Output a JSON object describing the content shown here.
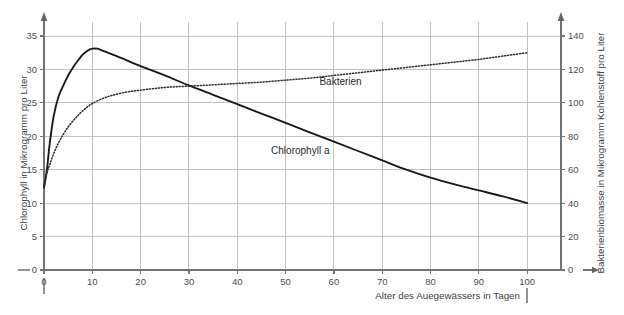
{
  "chart_data": {
    "type": "line",
    "title": "",
    "xlabel": "Alter des Auegewässers in Tagen",
    "ylabel": "Chlorophyll in Mikrogramm pro Liter",
    "y2label": "Bakterienbiomasse in Mikrogramm Kohlenstoff pro Liter",
    "xlim": [
      0,
      107
    ],
    "ylim": [
      0,
      36.5
    ],
    "y2lim": [
      0,
      146
    ],
    "grid": true,
    "legend_position": "inline-labels",
    "x_ticks": [
      0,
      10,
      20,
      30,
      40,
      50,
      60,
      70,
      80,
      90,
      100
    ],
    "x_tick_labels": [
      "0",
      "10",
      "20",
      "30",
      "40",
      "50",
      "60",
      "70",
      "80",
      "90",
      "100"
    ],
    "y_ticks": [
      0,
      5,
      10,
      15,
      20,
      25,
      30,
      35
    ],
    "y_tick_labels": [
      "0",
      "5",
      "10",
      "15",
      "20",
      "25",
      "30",
      "35"
    ],
    "y2_ticks": [
      0,
      20,
      40,
      60,
      80,
      100,
      120,
      140
    ],
    "y2_tick_labels": [
      "0",
      "20",
      "40",
      "60",
      "80",
      "100",
      "120",
      "140"
    ],
    "series": [
      {
        "name": "Chlorophyll a",
        "axis": "left",
        "style": "solid",
        "label_x": 47,
        "label_y": 17.9,
        "x": [
          0,
          0.6,
          1.2,
          2,
          3,
          4,
          5,
          6,
          7,
          8,
          9,
          10,
          11,
          12,
          14,
          17,
          20,
          25,
          30,
          35,
          40,
          45,
          50,
          55,
          60,
          65,
          70,
          75,
          80,
          85,
          90,
          95,
          100
        ],
        "y": [
          12.3,
          15.0,
          19.0,
          23.0,
          25.9,
          27.6,
          29.1,
          30.3,
          31.3,
          32.2,
          32.8,
          33.1,
          33.1,
          32.85,
          32.3,
          31.4,
          30.5,
          29.1,
          27.6,
          26.2,
          24.8,
          23.4,
          22.0,
          20.6,
          19.2,
          17.8,
          16.4,
          15.0,
          13.8,
          12.8,
          11.9,
          11.0,
          10.0
        ]
      },
      {
        "name": "Bakterien",
        "axis": "right",
        "style": "dotted",
        "label_x": 57,
        "label_y": 28.2,
        "x": [
          0,
          0.6,
          1.2,
          2,
          3,
          4,
          5,
          6,
          7,
          8,
          9,
          10,
          12,
          14,
          17,
          20,
          25,
          30,
          35,
          40,
          45,
          50,
          55,
          60,
          65,
          70,
          75,
          80,
          85,
          90,
          95,
          100
        ],
        "y_left_equiv": [
          12.3,
          14.5,
          15.8,
          17.4,
          19.0,
          20.3,
          21.4,
          22.3,
          23.1,
          23.8,
          24.4,
          24.9,
          25.6,
          26.1,
          26.6,
          26.9,
          27.3,
          27.5,
          27.7,
          27.9,
          28.1,
          28.4,
          28.7,
          29.1,
          29.5,
          29.9,
          30.3,
          30.7,
          31.1,
          31.5,
          32.0,
          32.5
        ],
        "y_right": [
          49.2,
          58.0,
          63.2,
          69.6,
          76.0,
          81.2,
          85.6,
          89.2,
          92.4,
          95.2,
          97.6,
          99.6,
          102.4,
          104.4,
          106.4,
          107.6,
          109.2,
          110.0,
          110.8,
          111.6,
          112.4,
          113.6,
          114.8,
          116.4,
          118.0,
          119.6,
          121.2,
          122.8,
          124.4,
          126.0,
          128.0,
          130.0
        ]
      }
    ]
  },
  "labels": {
    "y_axis_title": "Chlorophyll in Mikrogramm pro Liter",
    "y2_axis_title": "Bakterienbiomasse in Mikrogramm Kohlenstoff pro Liter",
    "x_axis_title": "Alter des Auegewässers in Tagen",
    "series_chlorophyll": "Chlorophyll a",
    "series_bakterien": "Bakterien"
  },
  "colors": {
    "background": "#ffffff",
    "grid": "#b9bcbe",
    "axis": "#6f7477",
    "series_solid": "#16181a",
    "series_dotted": "#2a2d2f",
    "text": "#3a3a3a"
  }
}
